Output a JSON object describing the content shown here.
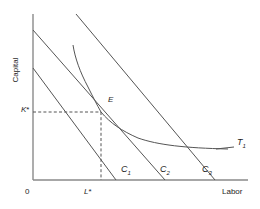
{
  "figure": {
    "type": "economics-isoquant-isocost-diagram",
    "title": "",
    "background_color": "#ffffff",
    "line_color": "#555555",
    "axis_color": "#808080",
    "curve_color": "#555555",
    "dash_color": "#555555"
  },
  "axes": {
    "y_label": "Capital",
    "x_label": "Labor",
    "origin_label": "0",
    "x_axis": {
      "x_start": 33,
      "x_end": 248,
      "y": 180
    },
    "y_axis": {
      "x": 33,
      "y_top": 14,
      "y_bottom": 180
    }
  },
  "ticks": {
    "y_tick": {
      "label_main": "K",
      "label_star": "*",
      "value_y": 112
    },
    "x_tick": {
      "label_main": "L",
      "label_star": "*",
      "value_x": 88
    }
  },
  "equilibrium": {
    "point_label": "E",
    "x": 101,
    "y": 112,
    "dashed_guides": true
  },
  "isocost_lines": [
    {
      "name": "C",
      "subscript": "1",
      "label_main": "C",
      "label_sub": "1",
      "y_intercept_px": 68,
      "x_intercept_px": 110,
      "from": [
        33,
        68
      ],
      "to": [
        116,
        180
      ]
    },
    {
      "name": "C",
      "subscript": "2",
      "label_main": "C",
      "label_sub": "2",
      "y_intercept_px": 30,
      "x_intercept_px": 165,
      "from": [
        33,
        30
      ],
      "to": [
        165,
        180
      ]
    },
    {
      "name": "C",
      "subscript": "3",
      "label_main": "C",
      "label_sub": "3",
      "y_intercept_px": 14,
      "x_intercept_px": 215,
      "from": [
        76,
        14
      ],
      "to": [
        215,
        180
      ]
    }
  ],
  "isoquant": {
    "label_main": "T",
    "label_sub": "1",
    "description": "convex-to-origin isoquant tangent to middle isocost at E",
    "path_points": [
      [
        73,
        45
      ],
      [
        78,
        62
      ],
      [
        85,
        80
      ],
      [
        93,
        97
      ],
      [
        101,
        112
      ],
      [
        115,
        126
      ],
      [
        132,
        136
      ],
      [
        152,
        142
      ],
      [
        175,
        146
      ],
      [
        200,
        148
      ],
      [
        228,
        149
      ]
    ]
  },
  "legend": {
    "visible": false
  }
}
